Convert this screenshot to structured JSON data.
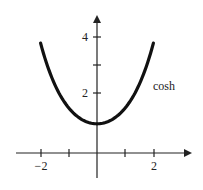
{
  "chart_data": {
    "type": "line",
    "title": "",
    "xlabel": "",
    "ylabel": "",
    "xlim": [
      -2.5,
      2.5
    ],
    "ylim": [
      -1,
      4.5
    ],
    "grid": false,
    "x_ticks": [
      -2,
      -1,
      1,
      2
    ],
    "x_tick_labels": [
      "−2",
      "",
      "",
      "2"
    ],
    "y_ticks": [
      2,
      3,
      4
    ],
    "y_tick_labels": [
      "2",
      "",
      "4"
    ],
    "series": [
      {
        "name": "cosh",
        "function": "cosh(x)",
        "x": [
          -2,
          -1.5,
          -1,
          -0.5,
          0,
          0.5,
          1,
          1.5,
          2
        ],
        "values": [
          3.76,
          2.35,
          1.54,
          1.13,
          1.0,
          1.13,
          1.54,
          2.35,
          3.76
        ]
      }
    ],
    "annotations": [
      {
        "text": "cosh",
        "x": 2.2,
        "y": 2.4
      }
    ]
  },
  "labels": {
    "x_neg2": "−2",
    "x_pos2": "2",
    "y_2": "2",
    "y_4": "4",
    "curve": "cosh"
  },
  "colors": {
    "curve": "#111111",
    "axes": "#222222"
  }
}
